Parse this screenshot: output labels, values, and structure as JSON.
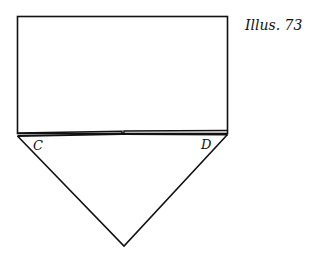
{
  "caption": "Illus. 73",
  "labels": {
    "left_corner": "C",
    "right_corner": "D"
  },
  "colors": {
    "line": "#111111",
    "background": "#ffffff"
  }
}
